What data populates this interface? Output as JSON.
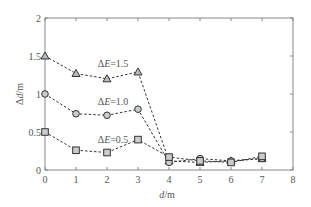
{
  "chart_data": {
    "type": "line",
    "title": "",
    "xlabel": "d/m",
    "ylabel": "Δd/m",
    "xlim": [
      0,
      8
    ],
    "ylim": [
      0,
      2
    ],
    "x_ticks": [
      "0",
      "1",
      "2",
      "3",
      "4",
      "5",
      "6",
      "7",
      "8"
    ],
    "y_ticks": [
      "0",
      "0.5",
      "1",
      "1.5",
      "2"
    ],
    "grid": false,
    "legend": "inline annotations",
    "x": [
      0,
      1,
      2,
      3,
      4,
      5,
      6,
      7
    ],
    "series": [
      {
        "name": "ΔE=1.5",
        "marker": "triangle",
        "values": [
          1.5,
          1.27,
          1.2,
          1.29,
          0.12,
          0.1,
          0.12,
          0.15
        ]
      },
      {
        "name": "ΔE=1.0",
        "marker": "circle",
        "values": [
          1.0,
          0.74,
          0.72,
          0.8,
          0.1,
          0.15,
          0.12,
          0.15
        ]
      },
      {
        "name": "ΔE=0.5",
        "marker": "square",
        "values": [
          0.5,
          0.26,
          0.23,
          0.4,
          0.17,
          0.12,
          0.1,
          0.18
        ]
      }
    ],
    "annotations": [
      {
        "text": "ΔE=1.5",
        "x": 1.7,
        "y": 1.36
      },
      {
        "text": "ΔE=1.0",
        "x": 1.7,
        "y": 0.86
      },
      {
        "text": "ΔE=0.5",
        "x": 1.7,
        "y": 0.36
      }
    ]
  }
}
